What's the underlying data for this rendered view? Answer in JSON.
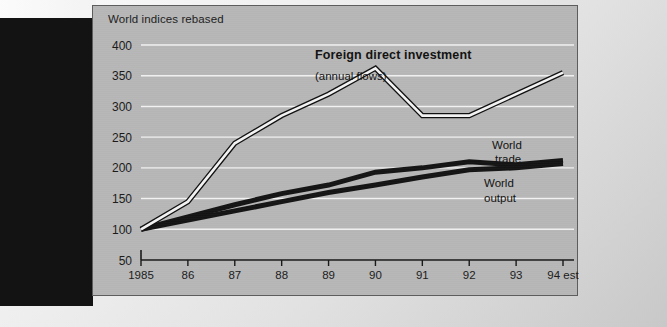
{
  "chart_title": "World indices rebased",
  "annotations": {
    "fdi_title": "Foreign direct investment",
    "fdi_subtitle": "(annual flows)",
    "world_trade_line1": "World",
    "world_trade_line2": "trade",
    "world_output_line1": "World",
    "world_output_line2": "output"
  },
  "colors": {
    "panel_background": "#b7b7b7",
    "gridline": "#f2f2f2",
    "axis": "#181818",
    "fdi_line_fill": "#f4f4f4",
    "fdi_line_outline": "#101010",
    "solid_line": "#141414",
    "left_bar": "#131313"
  },
  "chart_data": {
    "type": "line",
    "title": "World indices rebased",
    "xlabel": "",
    "ylabel": "",
    "grid": true,
    "legend_position": "inline-annotations",
    "x": [
      "1985",
      "86",
      "87",
      "88",
      "89",
      "90",
      "91",
      "92",
      "93",
      "94 est"
    ],
    "xtick_labels": [
      "1985",
      "86",
      "87",
      "88",
      "89",
      "90",
      "91",
      "92",
      "93",
      "94 est"
    ],
    "ytick_labels": [
      "50",
      "100",
      "150",
      "200",
      "250",
      "300",
      "350",
      "400"
    ],
    "ytick_values": [
      50,
      100,
      150,
      200,
      250,
      300,
      350,
      400
    ],
    "ylim": [
      50,
      400
    ],
    "series": [
      {
        "name": "Foreign direct investment (annual flows)",
        "style": "white-line-black-outline",
        "values": [
          100,
          145,
          240,
          285,
          320,
          362,
          285,
          285,
          320,
          355
        ]
      },
      {
        "name": "World trade",
        "style": "solid-black",
        "values": [
          100,
          120,
          140,
          158,
          172,
          193,
          200,
          210,
          205,
          212
        ]
      },
      {
        "name": "World output",
        "style": "solid-black",
        "values": [
          100,
          115,
          130,
          145,
          160,
          172,
          185,
          197,
          200,
          207
        ]
      }
    ]
  }
}
